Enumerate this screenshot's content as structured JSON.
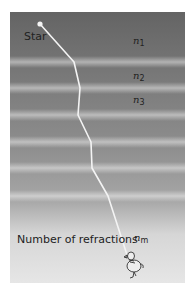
{
  "diagram": {
    "labels": {
      "star": "Star",
      "number_of_refractions": "Number of refractions"
    },
    "layers": [
      {
        "symbol": "n",
        "subscript": "1"
      },
      {
        "symbol": "n",
        "subscript": "2"
      },
      {
        "symbol": "n",
        "subscript": "3"
      },
      {
        "symbol": "n",
        "subscript": "m"
      }
    ],
    "ray_path_points": [
      [
        40,
        24
      ],
      [
        74,
        62
      ],
      [
        80,
        88
      ],
      [
        78,
        115
      ],
      [
        91,
        142
      ],
      [
        92,
        168
      ],
      [
        108,
        196
      ],
      [
        128,
        258
      ]
    ],
    "colors": {
      "panel_top": "#646464",
      "panel_bottom": "#e6e6e6",
      "ray": "#f4f4f4",
      "text": "#222222"
    },
    "observer_icon": "duck-figure"
  }
}
